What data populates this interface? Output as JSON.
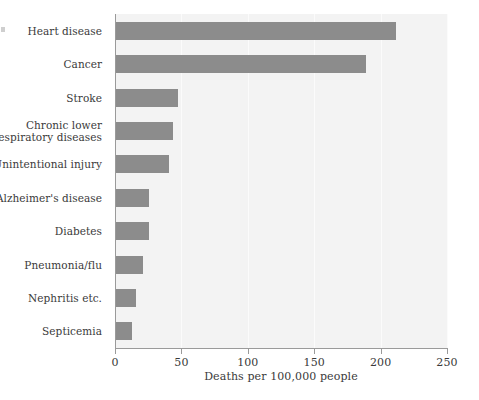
{
  "chart_data": {
    "type": "bar",
    "orientation": "horizontal",
    "title": "",
    "subtitle": "",
    "xlabel": "Deaths per 100,000 people",
    "ylabel": "",
    "xlim": [
      0,
      250
    ],
    "xticks": [
      0,
      50,
      100,
      150,
      200,
      250
    ],
    "xtick_labels": [
      "0",
      "50",
      "100",
      "150",
      "200",
      "250"
    ],
    "grid": true,
    "grid_axis": "x",
    "legend": false,
    "legend_position": "none",
    "categories": [
      "Heart disease",
      "Cancer",
      "Stroke",
      "Chronic lower respiratory diseases",
      "Unintentional injury",
      "Alzheimer's disease",
      "Diabetes",
      "Pneumonia/flu",
      "Nephritis etc.",
      "Septicemia"
    ],
    "category_label_lines": [
      [
        "Heart disease"
      ],
      [
        "Cancer"
      ],
      [
        "Stroke"
      ],
      [
        "Chronic lower",
        "respiratory diseases"
      ],
      [
        "Unintentional injury"
      ],
      [
        "Alzheimer's disease"
      ],
      [
        "Diabetes"
      ],
      [
        "Pneumonia/flu"
      ],
      [
        "Nephritis etc."
      ],
      [
        "Septicemia"
      ]
    ],
    "values": [
      211,
      188,
      47,
      43,
      40,
      25,
      25,
      20,
      15,
      12
    ],
    "series": [
      {
        "name": "Deaths per 100,000 people",
        "values": [
          211,
          188,
          47,
          43,
          40,
          25,
          25,
          20,
          15,
          12
        ]
      }
    ],
    "colors": {
      "bar": "#8c8c8c",
      "plot_background": "#f3f3f3",
      "gridline": "#fbfbfb",
      "axis": "#9a9a9a",
      "text": "#3a3a3a",
      "page_background": "#ffffff"
    }
  }
}
